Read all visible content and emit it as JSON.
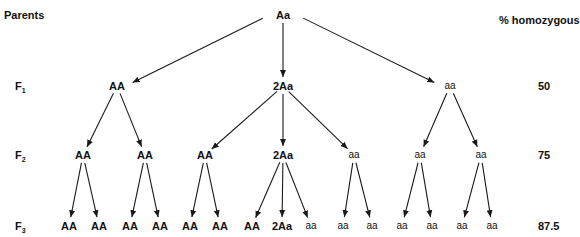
{
  "header": {
    "parents_label": "Parents",
    "homozygous_header": "% homozygous"
  },
  "generations": [
    {
      "label": "F",
      "sub": "1",
      "y": 86,
      "percent": "50"
    },
    {
      "label": "F",
      "sub": "2",
      "y": 155,
      "percent": "75"
    },
    {
      "label": "F",
      "sub": "3",
      "y": 226,
      "percent": "87.5"
    }
  ],
  "nodes": [
    {
      "id": "p",
      "text": "Aa",
      "x": 283,
      "y": 15,
      "style": "bold"
    },
    {
      "id": "f1a",
      "text": "AA",
      "x": 117,
      "y": 86,
      "style": "bold"
    },
    {
      "id": "f1b",
      "text": "2Aa",
      "x": 283,
      "y": 86,
      "style": "bold"
    },
    {
      "id": "f1c",
      "text": "aa",
      "x": 450,
      "y": 86,
      "style": "small"
    },
    {
      "id": "f2a",
      "text": "AA",
      "x": 83,
      "y": 155,
      "style": "bold"
    },
    {
      "id": "f2b",
      "text": "AA",
      "x": 145,
      "y": 155,
      "style": "bold"
    },
    {
      "id": "f2c",
      "text": "AA",
      "x": 205,
      "y": 155,
      "style": "bold"
    },
    {
      "id": "f2d",
      "text": "2Aa",
      "x": 283,
      "y": 155,
      "style": "bold"
    },
    {
      "id": "f2e",
      "text": "aa",
      "x": 354,
      "y": 155,
      "style": "small"
    },
    {
      "id": "f2f",
      "text": "aa",
      "x": 420,
      "y": 155,
      "style": "small"
    },
    {
      "id": "f2g",
      "text": "aa",
      "x": 481,
      "y": 155,
      "style": "small"
    },
    {
      "id": "f3a",
      "text": "AA",
      "x": 69,
      "y": 226,
      "style": "bold"
    },
    {
      "id": "f3b",
      "text": "AA",
      "x": 99,
      "y": 226,
      "style": "bold"
    },
    {
      "id": "f3c",
      "text": "AA",
      "x": 130,
      "y": 226,
      "style": "bold"
    },
    {
      "id": "f3d",
      "text": "AA",
      "x": 160,
      "y": 226,
      "style": "bold"
    },
    {
      "id": "f3e",
      "text": "AA",
      "x": 190,
      "y": 226,
      "style": "bold"
    },
    {
      "id": "f3f",
      "text": "AA",
      "x": 220,
      "y": 226,
      "style": "bold"
    },
    {
      "id": "f3g",
      "text": "AA",
      "x": 252,
      "y": 226,
      "style": "bold"
    },
    {
      "id": "f3h",
      "text": "2Aa",
      "x": 282,
      "y": 226,
      "style": "bold"
    },
    {
      "id": "f3i",
      "text": "aa",
      "x": 311,
      "y": 226,
      "style": "small"
    },
    {
      "id": "f3j",
      "text": "aa",
      "x": 343,
      "y": 226,
      "style": "small"
    },
    {
      "id": "f3k",
      "text": "aa",
      "x": 372,
      "y": 226,
      "style": "small"
    },
    {
      "id": "f3l",
      "text": "aa",
      "x": 402,
      "y": 226,
      "style": "small"
    },
    {
      "id": "f3m",
      "text": "aa",
      "x": 432,
      "y": 226,
      "style": "small"
    },
    {
      "id": "f3n",
      "text": "aa",
      "x": 462,
      "y": 226,
      "style": "small"
    },
    {
      "id": "f3o",
      "text": "aa",
      "x": 492,
      "y": 226,
      "style": "small"
    }
  ],
  "edges": [
    [
      "p",
      "f1a"
    ],
    [
      "p",
      "f1b"
    ],
    [
      "p",
      "f1c"
    ],
    [
      "f1a",
      "f2a"
    ],
    [
      "f1a",
      "f2b"
    ],
    [
      "f1b",
      "f2c"
    ],
    [
      "f1b",
      "f2d"
    ],
    [
      "f1b",
      "f2e"
    ],
    [
      "f1c",
      "f2f"
    ],
    [
      "f1c",
      "f2g"
    ],
    [
      "f2a",
      "f3a"
    ],
    [
      "f2a",
      "f3b"
    ],
    [
      "f2b",
      "f3c"
    ],
    [
      "f2b",
      "f3d"
    ],
    [
      "f2c",
      "f3e"
    ],
    [
      "f2c",
      "f3f"
    ],
    [
      "f2d",
      "f3g"
    ],
    [
      "f2d",
      "f3h"
    ],
    [
      "f2d",
      "f3i"
    ],
    [
      "f2e",
      "f3j"
    ],
    [
      "f2e",
      "f3k"
    ],
    [
      "f2f",
      "f3l"
    ],
    [
      "f2f",
      "f3m"
    ],
    [
      "f2g",
      "f3n"
    ],
    [
      "f2g",
      "f3o"
    ]
  ],
  "colors": {
    "line": "#1a1a1a",
    "text": "#111111"
  }
}
